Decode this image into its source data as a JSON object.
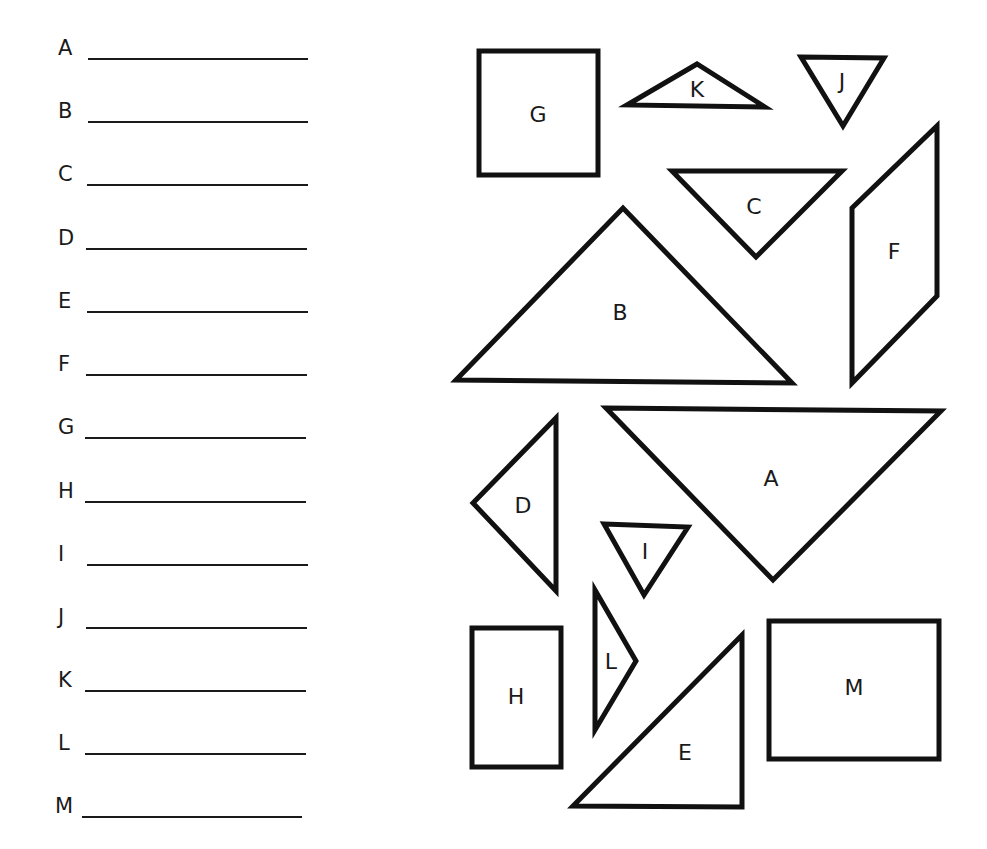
{
  "answer_lines": [
    {
      "letter": "A",
      "value": ""
    },
    {
      "letter": "B",
      "value": ""
    },
    {
      "letter": "C",
      "value": ""
    },
    {
      "letter": "D",
      "value": ""
    },
    {
      "letter": "E",
      "value": ""
    },
    {
      "letter": "F",
      "value": ""
    },
    {
      "letter": "G",
      "value": ""
    },
    {
      "letter": "H",
      "value": ""
    },
    {
      "letter": "I",
      "value": ""
    },
    {
      "letter": "J",
      "value": ""
    },
    {
      "letter": "K",
      "value": ""
    },
    {
      "letter": "L",
      "value": ""
    },
    {
      "letter": "M",
      "value": ""
    }
  ],
  "shapes": {
    "G": {
      "label": "G",
      "kind": "square"
    },
    "K": {
      "label": "K",
      "kind": "obtuse-triangle"
    },
    "J": {
      "label": "J",
      "kind": "equilateral-triangle"
    },
    "C": {
      "label": "C",
      "kind": "right-isosceles-triangle"
    },
    "F": {
      "label": "F",
      "kind": "parallelogram"
    },
    "B": {
      "label": "B",
      "kind": "right-isosceles-triangle"
    },
    "D": {
      "label": "D",
      "kind": "right-isosceles-triangle"
    },
    "A": {
      "label": "A",
      "kind": "right-isosceles-triangle"
    },
    "I": {
      "label": "I",
      "kind": "equilateral-triangle"
    },
    "L": {
      "label": "L",
      "kind": "scalene-triangle"
    },
    "H": {
      "label": "H",
      "kind": "rectangle"
    },
    "E": {
      "label": "E",
      "kind": "right-triangle"
    },
    "M": {
      "label": "M",
      "kind": "rectangle"
    }
  },
  "colors": {
    "ink": "#111111",
    "background": "#ffffff"
  }
}
